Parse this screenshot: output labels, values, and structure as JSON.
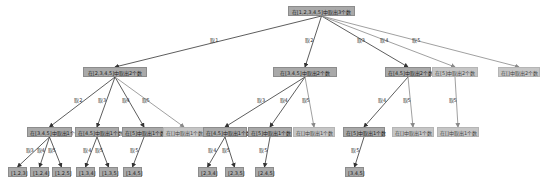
{
  "title": "在[1,2,3,4,5]中取出3个数",
  "colors": {
    "active_node": "#a9a9a9",
    "pruned_node": "#c6c6c6",
    "edge": "#333333",
    "pruned_edge": "#888888"
  },
  "nodes": [
    {
      "id": "root",
      "label": "在[1,2,3,4,5]中取出3个数",
      "x": 288,
      "y": 6,
      "w": 67,
      "state": "active"
    },
    {
      "id": "n1",
      "label": "在[2,3,4,5]中取出2个数",
      "x": 83,
      "y": 67,
      "w": 64,
      "state": "active"
    },
    {
      "id": "n2",
      "label": "在[3,4,5]中取出2个数",
      "x": 273,
      "y": 67,
      "w": 64,
      "state": "active"
    },
    {
      "id": "n3",
      "label": "在[4,5]中取出2个数",
      "x": 385,
      "y": 67,
      "w": 46,
      "state": "active"
    },
    {
      "id": "n4",
      "label": "在[5]中取出2个数",
      "x": 432,
      "y": 67,
      "w": 46,
      "state": "pruned"
    },
    {
      "id": "n5",
      "label": "在[]中取出2个数",
      "x": 498,
      "y": 67,
      "w": 42,
      "state": "pruned"
    },
    {
      "id": "n11",
      "label": "在[3,4,5]中取出1个数",
      "x": 27,
      "y": 127,
      "w": 45,
      "state": "active"
    },
    {
      "id": "n12",
      "label": "在[4,5]中取出1个数",
      "x": 75,
      "y": 127,
      "w": 44,
      "state": "active"
    },
    {
      "id": "n13",
      "label": "在[5]中取出1个数",
      "x": 122,
      "y": 127,
      "w": 44,
      "state": "active"
    },
    {
      "id": "n14",
      "label": "在[]中取出1个数",
      "x": 163,
      "y": 127,
      "w": 42,
      "state": "pruned"
    },
    {
      "id": "n21",
      "label": "在[4,5]中取出1个数",
      "x": 203,
      "y": 127,
      "w": 44,
      "state": "active"
    },
    {
      "id": "n22",
      "label": "在[5]中取出1个数",
      "x": 248,
      "y": 127,
      "w": 44,
      "state": "active"
    },
    {
      "id": "n23",
      "label": "在[]中取出1个数",
      "x": 293,
      "y": 127,
      "w": 42,
      "state": "pruned"
    },
    {
      "id": "n31",
      "label": "在[5]中取出1个数",
      "x": 343,
      "y": 127,
      "w": 42,
      "state": "active"
    },
    {
      "id": "n32",
      "label": "在[]中取出1个数",
      "x": 392,
      "y": 127,
      "w": 42,
      "state": "pruned"
    },
    {
      "id": "n41",
      "label": "在[]中取出1个数",
      "x": 437,
      "y": 127,
      "w": 42,
      "state": "pruned"
    },
    {
      "id": "l1",
      "label": "[1,2,3]",
      "x": 8,
      "y": 167,
      "w": 19,
      "state": "leaf"
    },
    {
      "id": "l2",
      "label": "[1,2,4]",
      "x": 30,
      "y": 167,
      "w": 19,
      "state": "leaf"
    },
    {
      "id": "l3",
      "label": "[1,2,5]",
      "x": 52,
      "y": 167,
      "w": 19,
      "state": "leaf"
    },
    {
      "id": "l4",
      "label": "[1,3,4]",
      "x": 76,
      "y": 167,
      "w": 19,
      "state": "leaf"
    },
    {
      "id": "l5",
      "label": "[1,3,5]",
      "x": 99,
      "y": 167,
      "w": 19,
      "state": "leaf"
    },
    {
      "id": "l6",
      "label": "[1,4,5]",
      "x": 123,
      "y": 167,
      "w": 19,
      "state": "leaf"
    },
    {
      "id": "l7",
      "label": "[2,3,4]",
      "x": 198,
      "y": 167,
      "w": 19,
      "state": "leaf"
    },
    {
      "id": "l8",
      "label": "[2,3,5]",
      "x": 225,
      "y": 167,
      "w": 19,
      "state": "leaf"
    },
    {
      "id": "l9",
      "label": "[2,4,5]",
      "x": 255,
      "y": 167,
      "w": 19,
      "state": "leaf"
    },
    {
      "id": "l10",
      "label": "[3,4,5]",
      "x": 345,
      "y": 167,
      "w": 19,
      "state": "leaf"
    }
  ],
  "edges": [
    {
      "from": "root",
      "to": "n1",
      "label": "取1",
      "pruned": false
    },
    {
      "from": "root",
      "to": "n2",
      "label": "取2",
      "pruned": false
    },
    {
      "from": "root",
      "to": "n3",
      "label": "取3",
      "pruned": false
    },
    {
      "from": "root",
      "to": "n4",
      "label": "取4",
      "pruned": true
    },
    {
      "from": "root",
      "to": "n5",
      "label": "取5",
      "pruned": true
    },
    {
      "from": "n1",
      "to": "n11",
      "label": "取2",
      "pruned": false
    },
    {
      "from": "n1",
      "to": "n12",
      "label": "取3",
      "pruned": false
    },
    {
      "from": "n1",
      "to": "n13",
      "label": "取4",
      "pruned": false
    },
    {
      "from": "n1",
      "to": "n14",
      "label": "取5",
      "pruned": true
    },
    {
      "from": "n2",
      "to": "n21",
      "label": "取3",
      "pruned": false
    },
    {
      "from": "n2",
      "to": "n22",
      "label": "取4",
      "pruned": false
    },
    {
      "from": "n2",
      "to": "n23",
      "label": "取5",
      "pruned": true
    },
    {
      "from": "n3",
      "to": "n31",
      "label": "取4",
      "pruned": false
    },
    {
      "from": "n3",
      "to": "n32",
      "label": "取5",
      "pruned": true
    },
    {
      "from": "n4",
      "to": "n41",
      "label": "取5",
      "pruned": true
    },
    {
      "from": "n11",
      "to": "l1",
      "label": "取3",
      "pruned": false
    },
    {
      "from": "n11",
      "to": "l2",
      "label": "取4",
      "pruned": false
    },
    {
      "from": "n11",
      "to": "l3",
      "label": "取5",
      "pruned": false
    },
    {
      "from": "n12",
      "to": "l4",
      "label": "取4",
      "pruned": false
    },
    {
      "from": "n12",
      "to": "l5",
      "label": "取5",
      "pruned": false
    },
    {
      "from": "n13",
      "to": "l6",
      "label": "取5",
      "pruned": false
    },
    {
      "from": "n21",
      "to": "l7",
      "label": "取4",
      "pruned": false
    },
    {
      "from": "n21",
      "to": "l8",
      "label": "取5",
      "pruned": false
    },
    {
      "from": "n22",
      "to": "l9",
      "label": "取5",
      "pruned": false
    },
    {
      "from": "n31",
      "to": "l10",
      "label": "取5",
      "pruned": false
    }
  ]
}
